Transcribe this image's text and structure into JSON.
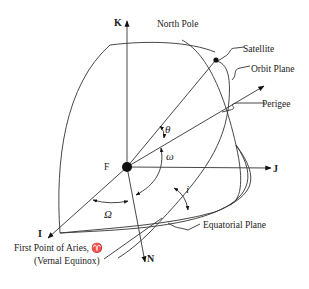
{
  "diagram": {
    "type": "orbital-elements",
    "axes": {
      "k": "K",
      "j": "J",
      "i": "I",
      "n": "N"
    },
    "origin_label": "F",
    "labels": {
      "north_pole": "North Pole",
      "satellite": "Satellite",
      "orbit_plane": "Orbit Plane",
      "perigee": "Perigee",
      "equatorial_plane": "Equatorial Plane",
      "aries_line1": "First Point of Aries, ♈",
      "aries_line2": "(Vernal Equinox)"
    },
    "angles": {
      "true_anomaly": "θ",
      "argument_of_perigee": "ω",
      "raan": "Ω",
      "inclination": "i"
    },
    "colors": {
      "line": "#333333",
      "text": "#222222",
      "background": "#ffffff"
    }
  }
}
